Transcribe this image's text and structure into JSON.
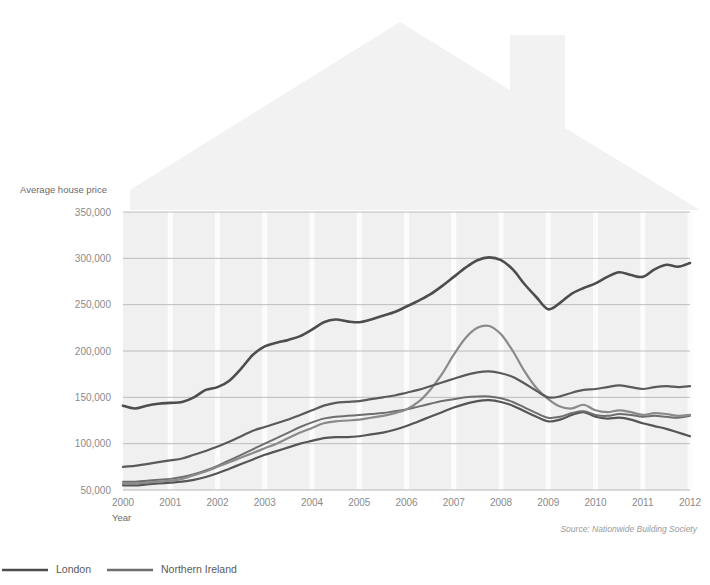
{
  "chart_data": {
    "type": "line",
    "title": "",
    "xlabel": "Year",
    "ylabel": "Average house price",
    "xlim": [
      2000,
      2012
    ],
    "ylim": [
      50000,
      350000
    ],
    "grid": true,
    "legend_position": "bottom-left",
    "source": "Source: Nationwide Building Society",
    "x_ticks": [
      "2000",
      "2001",
      "2002",
      "2003",
      "2004",
      "2005",
      "2006",
      "2007",
      "2008",
      "2009",
      "2010",
      "2011",
      "2012"
    ],
    "y_ticks": [
      "350,000",
      "300,000",
      "250,000",
      "200,000",
      "150,000",
      "100,000",
      "50,000"
    ],
    "y_tick_values": [
      350000,
      300000,
      250000,
      200000,
      150000,
      100000,
      50000
    ],
    "x": [
      2000,
      2000.25,
      2000.5,
      2000.75,
      2001,
      2001.25,
      2001.5,
      2001.75,
      2002,
      2002.25,
      2002.5,
      2002.75,
      2003,
      2003.25,
      2003.5,
      2003.75,
      2004,
      2004.25,
      2004.5,
      2004.75,
      2005,
      2005.25,
      2005.5,
      2005.75,
      2006,
      2006.25,
      2006.5,
      2006.75,
      2007,
      2007.25,
      2007.5,
      2007.75,
      2008,
      2008.25,
      2008.5,
      2008.75,
      2009,
      2009.25,
      2009.5,
      2009.75,
      2010,
      2010.25,
      2010.5,
      2010.75,
      2011,
      2011.25,
      2011.5,
      2011.75,
      2012
    ],
    "series": [
      {
        "name": "London",
        "color": "#4d4d4d",
        "width": 2.6,
        "values": [
          141000,
          138000,
          141000,
          143000,
          144000,
          145000,
          150000,
          158000,
          161000,
          168000,
          181000,
          196000,
          205000,
          209000,
          212000,
          216000,
          223000,
          231000,
          234000,
          232000,
          231000,
          234000,
          238000,
          242000,
          248000,
          254000,
          261000,
          270000,
          280000,
          290000,
          298000,
          301000,
          298000,
          288000,
          272000,
          258000,
          245000,
          252000,
          262000,
          268000,
          273000,
          280000,
          285000,
          282000,
          280000,
          288000,
          293000,
          291000,
          295000
        ]
      },
      {
        "name": "Northern Ireland",
        "color": "#8a8a8a",
        "width": 2.2,
        "values": [
          57000,
          57000,
          58000,
          59000,
          60000,
          62000,
          66000,
          70000,
          75000,
          80000,
          85000,
          90000,
          95000,
          100000,
          106000,
          112000,
          117000,
          122000,
          124000,
          125000,
          126000,
          128000,
          130000,
          133000,
          137000,
          145000,
          158000,
          175000,
          196000,
          214000,
          225000,
          227000,
          218000,
          200000,
          178000,
          160000,
          148000,
          140000,
          138000,
          142000,
          136000,
          134000,
          136000,
          134000,
          131000,
          133000,
          132000,
          130000,
          131000
        ]
      },
      {
        "name": "South East",
        "color": "#5a5a5a",
        "width": 2.2,
        "values": [
          75000,
          76000,
          78000,
          80000,
          82000,
          84000,
          88000,
          92000,
          97000,
          102000,
          108000,
          114000,
          118000,
          122000,
          126000,
          131000,
          136000,
          141000,
          144000,
          145000,
          146000,
          148000,
          150000,
          152000,
          155000,
          158000,
          162000,
          166000,
          170000,
          174000,
          177000,
          178000,
          176000,
          172000,
          165000,
          157000,
          150000,
          151000,
          155000,
          158000,
          159000,
          161000,
          163000,
          161000,
          159000,
          161000,
          162000,
          161000,
          162000
        ]
      },
      {
        "name": "Wales",
        "color": "#6e6e6e",
        "width": 2.0,
        "values": [
          59000,
          59000,
          60000,
          61000,
          62000,
          64000,
          67000,
          71000,
          76000,
          82000,
          88000,
          94000,
          100000,
          106000,
          112000,
          118000,
          123000,
          127000,
          129000,
          130000,
          131000,
          132000,
          133000,
          135000,
          137000,
          140000,
          143000,
          146000,
          148000,
          150000,
          151000,
          151000,
          149000,
          145000,
          139000,
          133000,
          128000,
          129000,
          133000,
          135000,
          131000,
          130000,
          132000,
          131000,
          129000,
          130000,
          129000,
          128000,
          130000
        ]
      },
      {
        "name": "North",
        "color": "#555555",
        "width": 2.2,
        "values": [
          55000,
          55000,
          56000,
          57000,
          58000,
          59000,
          61000,
          64000,
          68000,
          73000,
          78000,
          83000,
          88000,
          92000,
          96000,
          100000,
          103000,
          106000,
          107000,
          107000,
          108000,
          110000,
          112000,
          115000,
          119000,
          124000,
          129000,
          134000,
          139000,
          143000,
          146000,
          147000,
          145000,
          141000,
          135000,
          129000,
          124000,
          126000,
          131000,
          134000,
          129000,
          127000,
          128000,
          126000,
          122000,
          119000,
          116000,
          112000,
          108000
        ]
      }
    ],
    "legend": [
      {
        "label": "London",
        "color": "#4d4d4d"
      },
      {
        "label": "Northern Ireland",
        "color": "#6e6e6e"
      }
    ]
  },
  "watermark": {
    "name": "house-roof-watermark",
    "color": "#f2f2f2"
  }
}
